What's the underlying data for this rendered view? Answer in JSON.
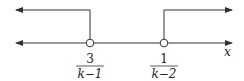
{
  "diagram": {
    "type": "number-line",
    "axis_label": "x",
    "points": [
      {
        "numerator": "3",
        "denominator": "k−1",
        "open": true
      },
      {
        "numerator": "1",
        "denominator": "k−2",
        "open": true
      }
    ],
    "regions": [
      "x < 3/(k-1)",
      "x > 1/(k-2)"
    ],
    "colors": {
      "line": "#333333",
      "background": "#ffffff"
    }
  }
}
